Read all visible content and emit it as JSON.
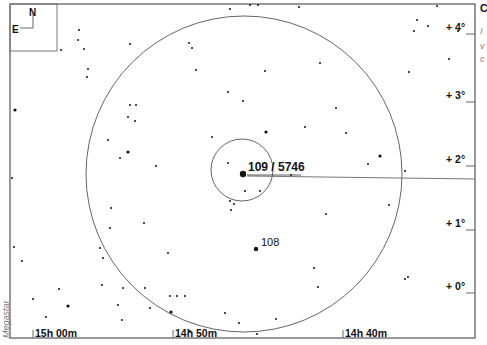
{
  "chart_data": {
    "type": "scatter",
    "credit": "Megastar",
    "compass": {
      "north": "N",
      "east": "E"
    },
    "ra_labels": [
      {
        "label": "15h 00m",
        "x": 33
      },
      {
        "label": "14h 50m",
        "x": 173
      },
      {
        "label": "14h 40m",
        "x": 343
      }
    ],
    "dec_labels": [
      {
        "label": "+ 4°",
        "y": 31
      },
      {
        "label": "+ 3°",
        "y": 99
      },
      {
        "label": "+ 2°",
        "y": 163
      },
      {
        "label": "+ 1°",
        "y": 227
      },
      {
        "label": "+ 0°",
        "y": 290
      }
    ],
    "objects": [
      {
        "label": "109 / 5746",
        "x": 243,
        "y": 174,
        "r": 3.2
      },
      {
        "label": "108",
        "x": 256,
        "y": 249,
        "r": 2.2
      }
    ],
    "finder_circles": [
      {
        "name": "large",
        "cx": 244,
        "cy": 174,
        "r": 158
      },
      {
        "name": "small",
        "cx": 242,
        "cy": 170,
        "r": 31
      }
    ],
    "pointer_line": {
      "x1": 247,
      "y1": 176,
      "x2": 475,
      "y2": 179
    },
    "side_text_fragments": [
      "C",
      "I",
      "v",
      "c"
    ],
    "stars": [
      [
        230,
        9,
        1
      ],
      [
        250,
        5,
        1
      ],
      [
        258,
        5,
        1
      ],
      [
        299,
        7,
        1
      ],
      [
        79,
        30,
        1
      ],
      [
        78,
        40,
        1
      ],
      [
        189,
        43,
        1
      ],
      [
        192,
        48,
        1
      ],
      [
        437,
        6,
        1
      ],
      [
        417,
        20,
        1
      ],
      [
        414,
        31,
        1
      ],
      [
        428,
        26,
        1
      ],
      [
        458,
        31,
        1
      ],
      [
        449,
        59,
        1
      ],
      [
        409,
        72,
        1
      ],
      [
        87,
        77,
        1
      ],
      [
        130,
        44,
        1
      ],
      [
        61,
        50,
        1
      ],
      [
        15,
        110,
        1.6
      ],
      [
        84,
        49,
        1
      ],
      [
        136,
        105,
        1
      ],
      [
        128,
        117,
        1
      ],
      [
        130,
        105,
        1
      ],
      [
        135,
        121,
        1
      ],
      [
        108,
        140,
        1
      ],
      [
        128,
        152,
        1.6
      ],
      [
        120,
        158,
        1
      ],
      [
        156,
        166,
        1
      ],
      [
        88,
        69,
        1
      ],
      [
        196,
        70,
        1
      ],
      [
        228,
        92,
        1
      ],
      [
        243,
        101,
        1
      ],
      [
        265,
        71,
        1
      ],
      [
        266,
        132,
        1.6
      ],
      [
        212,
        137,
        1
      ],
      [
        245,
        191,
        1
      ],
      [
        228,
        163,
        1
      ],
      [
        305,
        127,
        1
      ],
      [
        320,
        63,
        1
      ],
      [
        346,
        133,
        1
      ],
      [
        380,
        156,
        1.6
      ],
      [
        368,
        164,
        1
      ],
      [
        405,
        171,
        1
      ],
      [
        389,
        205,
        1
      ],
      [
        326,
        214,
        1
      ],
      [
        336,
        108,
        1
      ],
      [
        12,
        178,
        1
      ],
      [
        14,
        247,
        1
      ],
      [
        22,
        261,
        1
      ],
      [
        33,
        299,
        1
      ],
      [
        46,
        317,
        1
      ],
      [
        68,
        306,
        1.6
      ],
      [
        59,
        289,
        1
      ],
      [
        100,
        248,
        1
      ],
      [
        110,
        228,
        1
      ],
      [
        102,
        285,
        1
      ],
      [
        111,
        208,
        1
      ],
      [
        144,
        223,
        1
      ],
      [
        145,
        288,
        1
      ],
      [
        150,
        308,
        1
      ],
      [
        118,
        305,
        1
      ],
      [
        122,
        320,
        1
      ],
      [
        103,
        258,
        1
      ],
      [
        123,
        288,
        1
      ],
      [
        170,
        296,
        1
      ],
      [
        177,
        296,
        1
      ],
      [
        185,
        296,
        1
      ],
      [
        168,
        253,
        1
      ],
      [
        171,
        312,
        1.6
      ],
      [
        234,
        204,
        1
      ],
      [
        260,
        191,
        1
      ],
      [
        231,
        210,
        1
      ],
      [
        314,
        268,
        1
      ],
      [
        318,
        287,
        1
      ],
      [
        405,
        279,
        1
      ],
      [
        408,
        277,
        1
      ],
      [
        239,
        323,
        1
      ],
      [
        257,
        334,
        1
      ],
      [
        225,
        313,
        1
      ],
      [
        190,
        331,
        1
      ],
      [
        276,
        319,
        1
      ],
      [
        230,
        201,
        1
      ],
      [
        291,
        175,
        1
      ]
    ]
  }
}
